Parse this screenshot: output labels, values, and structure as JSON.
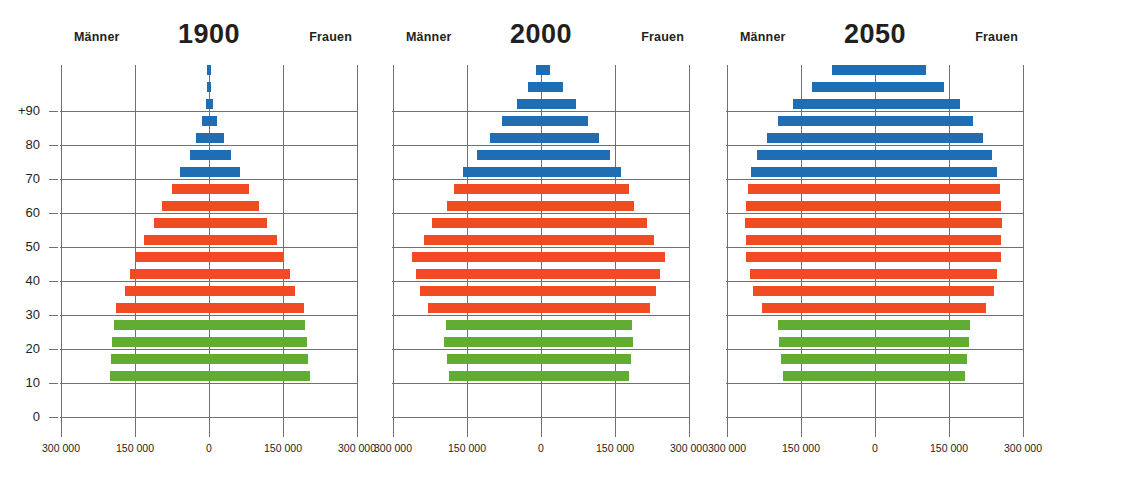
{
  "figure": {
    "men_label": "Männer",
    "women_label": "Frauen",
    "y_tick_labels": [
      "+90",
      "80",
      "70",
      "60",
      "50",
      "40",
      "30",
      "20",
      "10",
      "0"
    ],
    "x_tick_labels": [
      "300 000",
      "150 000",
      "0",
      "150 000",
      "300 000"
    ],
    "colors": {
      "green": "#61ac32",
      "orange": "#f04b23",
      "blue": "#1f6eb4",
      "axis": "#6f7072",
      "text": "#231f20"
    }
  },
  "panels": [
    {
      "title": "1900"
    },
    {
      "title": "2000"
    },
    {
      "title": "2050"
    }
  ],
  "chart_data": [
    {
      "type": "bar",
      "title": "1900",
      "subtitle": "",
      "orientation": "horizontal-diverging",
      "xlabel": "",
      "ylabel": "Alter",
      "xlim": [
        -300000,
        300000
      ],
      "ylim": [
        0,
        95
      ],
      "grid": true,
      "legend_position": "none",
      "categories": [
        "0-4",
        "5-9",
        "10-14",
        "15-19",
        "20-24",
        "25-29",
        "30-34",
        "35-39",
        "40-44",
        "45-49",
        "50-54",
        "55-59",
        "60-64",
        "65-69",
        "70-74",
        "75-79",
        "80-84",
        "85-89",
        "90+"
      ],
      "color_by_category": [
        "green",
        "green",
        "green",
        "green",
        "orange",
        "orange",
        "orange",
        "orange",
        "orange",
        "orange",
        "orange",
        "orange",
        "blue",
        "blue",
        "blue",
        "blue",
        "blue",
        "blue",
        "blue"
      ],
      "series": [
        {
          "name": "Männer",
          "values": [
            200000,
            198000,
            196000,
            192000,
            188000,
            170000,
            160000,
            148000,
            132000,
            112000,
            96000,
            76000,
            58000,
            38000,
            26000,
            14000,
            6000,
            2000,
            500
          ]
        },
        {
          "name": "Frauen",
          "values": [
            204000,
            200000,
            198000,
            195000,
            192000,
            174000,
            164000,
            152000,
            138000,
            118000,
            102000,
            82000,
            62000,
            44000,
            30000,
            17000,
            8000,
            3000,
            700
          ]
        }
      ]
    },
    {
      "type": "bar",
      "title": "2000",
      "subtitle": "",
      "orientation": "horizontal-diverging",
      "xlabel": "",
      "ylabel": "Alter",
      "xlim": [
        -300000,
        300000
      ],
      "ylim": [
        0,
        95
      ],
      "grid": true,
      "legend_position": "none",
      "categories": [
        "0-4",
        "5-9",
        "10-14",
        "15-19",
        "20-24",
        "25-29",
        "30-34",
        "35-39",
        "40-44",
        "45-49",
        "50-54",
        "55-59",
        "60-64",
        "65-69",
        "70-74",
        "75-79",
        "80-84",
        "85-89",
        "90+"
      ],
      "color_by_category": [
        "green",
        "green",
        "green",
        "green",
        "orange",
        "orange",
        "orange",
        "orange",
        "orange",
        "orange",
        "orange",
        "orange",
        "blue",
        "blue",
        "blue",
        "blue",
        "blue",
        "blue",
        "blue"
      ],
      "series": [
        {
          "name": "Männer",
          "values": [
            186000,
            190000,
            196000,
            192000,
            230000,
            246000,
            254000,
            262000,
            238000,
            220000,
            190000,
            176000,
            158000,
            130000,
            104000,
            80000,
            48000,
            26000,
            10000
          ]
        },
        {
          "name": "Frauen",
          "values": [
            178000,
            182000,
            186000,
            184000,
            220000,
            234000,
            242000,
            252000,
            230000,
            214000,
            188000,
            178000,
            162000,
            140000,
            118000,
            96000,
            70000,
            44000,
            18000
          ]
        }
      ]
    },
    {
      "type": "bar",
      "title": "2050",
      "subtitle": "",
      "orientation": "horizontal-diverging",
      "xlabel": "",
      "ylabel": "Alter",
      "xlim": [
        -300000,
        300000
      ],
      "ylim": [
        0,
        95
      ],
      "grid": true,
      "legend_position": "none",
      "categories": [
        "0-4",
        "5-9",
        "10-14",
        "15-19",
        "20-24",
        "25-29",
        "30-34",
        "35-39",
        "40-44",
        "45-49",
        "50-54",
        "55-59",
        "60-64",
        "65-69",
        "70-74",
        "75-79",
        "80-84",
        "85-89",
        "90+"
      ],
      "color_by_category": [
        "green",
        "green",
        "green",
        "green",
        "orange",
        "orange",
        "orange",
        "orange",
        "orange",
        "orange",
        "orange",
        "orange",
        "blue",
        "blue",
        "blue",
        "blue",
        "blue",
        "blue",
        "blue"
      ],
      "series": [
        {
          "name": "Männer",
          "values": [
            186000,
            190000,
            194000,
            196000,
            230000,
            248000,
            254000,
            262000,
            262000,
            264000,
            262000,
            258000,
            252000,
            240000,
            218000,
            196000,
            166000,
            128000,
            88000
          ]
        },
        {
          "name": "Frauen",
          "values": [
            182000,
            186000,
            190000,
            192000,
            224000,
            242000,
            248000,
            256000,
            256000,
            258000,
            256000,
            254000,
            248000,
            238000,
            218000,
            198000,
            172000,
            140000,
            104000
          ]
        }
      ]
    }
  ]
}
